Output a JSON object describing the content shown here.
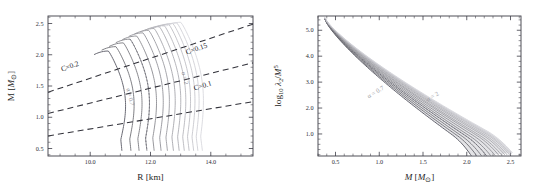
{
  "figure": {
    "background_color": "#ffffff",
    "panel_count": 2,
    "curve_color_light": "#d2d2d8",
    "curve_color_dark": "#5a5a64",
    "dashed_line_color": "#32323a",
    "axis_color": "#3c3c46"
  },
  "chart_data": [
    {
      "type": "line",
      "panel": "left",
      "title": "",
      "xlabel_text": "R",
      "xlabel_unit": "[km]",
      "ylabel_text": "M",
      "ylabel_unit": "[M⊙]",
      "xlim": [
        8.6,
        15.4
      ],
      "ylim": [
        0.38,
        2.62
      ],
      "xticks": [
        10.0,
        12.0,
        14.0
      ],
      "xticklabels": [
        "10.0",
        "12.0",
        "14.0"
      ],
      "yticks": [
        0.5,
        1.0,
        1.5,
        2.0,
        2.5
      ],
      "yticklabels": [
        "0.5",
        "1.0",
        "1.5",
        "2.0",
        "2.5"
      ],
      "xminor_step": 0.5,
      "yminor_step": 0.1,
      "grid": false,
      "legend_position": "none",
      "annotations": [
        {
          "text": "C=0.2",
          "x": 9.35,
          "y": 1.78,
          "rotation": -19
        },
        {
          "text": "C=0.15",
          "x": 13.55,
          "y": 2.06,
          "rotation": -19
        },
        {
          "text": "C=0.1",
          "x": 13.75,
          "y": 1.47,
          "rotation": -16
        },
        {
          "text": "α = 0.7",
          "x": 11.27,
          "y": 1.32,
          "rotation": 76
        },
        {
          "text": "α = 2",
          "x": 13.08,
          "y": 1.62,
          "rotation": 76
        }
      ],
      "compactness_lines": [
        {
          "label": "C=0.2",
          "value": 0.2,
          "m_at_xmin": 1.4,
          "m_at_xmax": 2.49
        },
        {
          "label": "C=0.15",
          "value": 0.15,
          "m_at_xmin": 1.06,
          "m_at_xmax": 1.87
        },
        {
          "label": "C=0.1",
          "value": 0.1,
          "m_at_xmin": 0.7,
          "m_at_xmax": 1.25
        }
      ],
      "series": [
        {
          "name": "alpha=0.7",
          "alpha": 0.7,
          "max_mass": 2.06,
          "radius_at_max": 10.6,
          "radius_at_low_mass": 11.05
        },
        {
          "name": "alpha=0.8",
          "alpha": 0.8,
          "max_mass": 2.13,
          "radius_at_max": 10.85,
          "radius_at_low_mass": 11.35
        },
        {
          "name": "alpha=0.9",
          "alpha": 0.9,
          "max_mass": 2.19,
          "radius_at_max": 11.1,
          "radius_at_low_mass": 11.62
        },
        {
          "name": "alpha=1.0",
          "alpha": 1.0,
          "max_mass": 2.25,
          "radius_at_max": 11.32,
          "radius_at_low_mass": 11.88
        },
        {
          "name": "alpha=1.1",
          "alpha": 1.1,
          "max_mass": 2.3,
          "radius_at_max": 11.54,
          "radius_at_low_mass": 12.12
        },
        {
          "name": "alpha=1.2",
          "alpha": 1.2,
          "max_mass": 2.35,
          "radius_at_max": 11.75,
          "radius_at_low_mass": 12.35
        },
        {
          "name": "alpha=1.3",
          "alpha": 1.3,
          "max_mass": 2.39,
          "radius_at_max": 11.94,
          "radius_at_low_mass": 12.56
        },
        {
          "name": "alpha=1.4",
          "alpha": 1.4,
          "max_mass": 2.42,
          "radius_at_max": 12.12,
          "radius_at_low_mass": 12.76
        },
        {
          "name": "alpha=1.5",
          "alpha": 1.5,
          "max_mass": 2.45,
          "radius_at_max": 12.29,
          "radius_at_low_mass": 12.95
        },
        {
          "name": "alpha=1.6",
          "alpha": 1.6,
          "max_mass": 2.47,
          "radius_at_max": 12.45,
          "radius_at_low_mass": 13.12
        },
        {
          "name": "alpha=1.7",
          "alpha": 1.7,
          "max_mass": 2.49,
          "radius_at_max": 12.6,
          "radius_at_low_mass": 13.28
        },
        {
          "name": "alpha=1.8",
          "alpha": 1.8,
          "max_mass": 2.5,
          "radius_at_max": 12.74,
          "radius_at_low_mass": 13.43
        },
        {
          "name": "alpha=1.9",
          "alpha": 1.9,
          "max_mass": 2.51,
          "radius_at_max": 12.87,
          "radius_at_low_mass": 13.57
        },
        {
          "name": "alpha=2.0",
          "alpha": 2.0,
          "max_mass": 2.52,
          "radius_at_max": 13.0,
          "radius_at_low_mass": 13.72
        }
      ]
    },
    {
      "type": "line",
      "panel": "right",
      "title": "",
      "xlabel_text": "M",
      "xlabel_unit": "[M⊙]",
      "ylabel_text": "log",
      "ylabel_sub": "10",
      "ylabel_num": "λ",
      "ylabel_num_sub": "2",
      "ylabel_den": "/M",
      "ylabel_den_sup": "5",
      "xlim": [
        0.3,
        2.62
      ],
      "ylim": [
        0.15,
        5.55
      ],
      "xticks": [
        0.5,
        1.0,
        1.5,
        2.0,
        2.5
      ],
      "xticklabels": [
        "0.5",
        "1.0",
        "1.5",
        "2.0",
        "2.5"
      ],
      "yticks": [
        1.0,
        2.0,
        3.0,
        4.0,
        5.0
      ],
      "yticklabels": [
        "1.0",
        "2.0",
        "3.0",
        "4.0",
        "5.0"
      ],
      "xminor_step": 0.1,
      "yminor_step": 0.2,
      "grid": false,
      "legend_position": "none",
      "annotations": [
        {
          "text": "α = 0.7",
          "x": 0.97,
          "y": 2.55,
          "rotation": -31
        },
        {
          "text": "α = 2",
          "x": 1.62,
          "y": 2.38,
          "rotation": -31
        }
      ],
      "series": [
        {
          "name": "alpha=0.7",
          "alpha": 0.7,
          "m_start": 0.38,
          "lam_start": 5.42,
          "m_end": 2.06,
          "lam_end": 0.42
        },
        {
          "name": "alpha=0.8",
          "alpha": 0.8,
          "m_start": 0.38,
          "lam_start": 5.42,
          "m_end": 2.13,
          "lam_end": 0.38
        },
        {
          "name": "alpha=0.9",
          "alpha": 0.9,
          "m_start": 0.38,
          "lam_start": 5.43,
          "m_end": 2.19,
          "lam_end": 0.36
        },
        {
          "name": "alpha=1.0",
          "alpha": 1.0,
          "m_start": 0.38,
          "lam_start": 5.43,
          "m_end": 2.25,
          "lam_end": 0.35
        },
        {
          "name": "alpha=1.1",
          "alpha": 1.1,
          "m_start": 0.38,
          "lam_start": 5.44,
          "m_end": 2.3,
          "lam_end": 0.35
        },
        {
          "name": "alpha=1.2",
          "alpha": 1.2,
          "m_start": 0.38,
          "lam_start": 5.44,
          "m_end": 2.35,
          "lam_end": 0.36
        },
        {
          "name": "alpha=1.3",
          "alpha": 1.3,
          "m_start": 0.38,
          "lam_start": 5.45,
          "m_end": 2.39,
          "lam_end": 0.38
        },
        {
          "name": "alpha=1.4",
          "alpha": 1.4,
          "m_start": 0.38,
          "lam_start": 5.45,
          "m_end": 2.42,
          "lam_end": 0.4
        },
        {
          "name": "alpha=1.5",
          "alpha": 1.5,
          "m_start": 0.38,
          "lam_start": 5.46,
          "m_end": 2.45,
          "lam_end": 0.43
        },
        {
          "name": "alpha=1.6",
          "alpha": 1.6,
          "m_start": 0.38,
          "lam_start": 5.46,
          "m_end": 2.47,
          "lam_end": 0.46
        },
        {
          "name": "alpha=1.7",
          "alpha": 1.7,
          "m_start": 0.38,
          "lam_start": 5.47,
          "m_end": 2.49,
          "lam_end": 0.49
        },
        {
          "name": "alpha=1.8",
          "alpha": 1.8,
          "m_start": 0.38,
          "lam_start": 5.47,
          "m_end": 2.5,
          "lam_end": 0.52
        },
        {
          "name": "alpha=1.9",
          "alpha": 1.9,
          "m_start": 0.38,
          "lam_start": 5.48,
          "m_end": 2.51,
          "lam_end": 0.55
        },
        {
          "name": "alpha=2.0",
          "alpha": 2.0,
          "m_start": 0.38,
          "lam_start": 5.48,
          "m_end": 2.52,
          "lam_end": 0.58
        }
      ]
    }
  ]
}
